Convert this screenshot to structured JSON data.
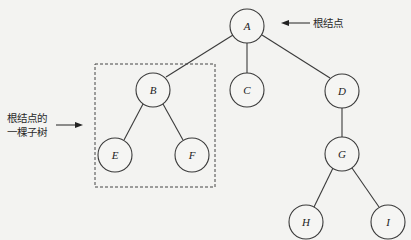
{
  "diagram": {
    "type": "tree",
    "nodes": [
      {
        "id": "A",
        "label": "A",
        "x": 247,
        "y": 26
      },
      {
        "id": "B",
        "label": "B",
        "x": 153,
        "y": 90
      },
      {
        "id": "C",
        "label": "C",
        "x": 247,
        "y": 90
      },
      {
        "id": "D",
        "label": "D",
        "x": 342,
        "y": 91
      },
      {
        "id": "E",
        "label": "E",
        "x": 115,
        "y": 155
      },
      {
        "id": "F",
        "label": "F",
        "x": 192,
        "y": 155
      },
      {
        "id": "G",
        "label": "G",
        "x": 342,
        "y": 154
      },
      {
        "id": "H",
        "label": "H",
        "x": 306,
        "y": 222
      },
      {
        "id": "I",
        "label": "I",
        "x": 388,
        "y": 222
      }
    ],
    "edges": [
      [
        "A",
        "B"
      ],
      [
        "A",
        "C"
      ],
      [
        "A",
        "D"
      ],
      [
        "B",
        "E"
      ],
      [
        "B",
        "F"
      ],
      [
        "D",
        "G"
      ],
      [
        "G",
        "H"
      ],
      [
        "G",
        "I"
      ]
    ],
    "annotations": {
      "root_label": "根结点",
      "subtree_label_line1": "根结点的",
      "subtree_label_line2": "一棵子树"
    }
  }
}
